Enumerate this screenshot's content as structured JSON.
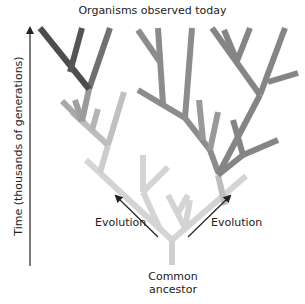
{
  "diagram": {
    "title": "Organisms observed today",
    "y_axis_label": "Time (thousands of generations)",
    "left_arrow_label": "Evolution",
    "right_arrow_label": "Evolution",
    "root_label_line1": "Common",
    "root_label_line2": "ancestor",
    "colors": {
      "branch_dark": "#555555",
      "branch_mid": "#8a8a8a",
      "branch_light": "#d8d8d8",
      "arrow": "#222222",
      "text": "#222222"
    }
  }
}
